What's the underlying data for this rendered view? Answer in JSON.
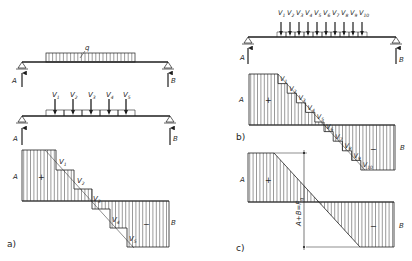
{
  "figure": {
    "panels": {
      "a": {
        "tag": "a)",
        "distributed_load_label": "q",
        "reaction_left": "A",
        "reaction_right": "B",
        "point_loads": [
          "V",
          "V",
          "V",
          "V",
          "V"
        ],
        "point_load_subs": [
          "1",
          "2",
          "3",
          "4",
          "5"
        ],
        "shear_labels": {
          "left": "A",
          "right": "B",
          "positive": "+",
          "negative": "−"
        }
      },
      "b": {
        "tag": "b)",
        "reaction_left": "A",
        "reaction_right": "B",
        "point_loads": [
          "V",
          "V",
          "V",
          "V",
          "V",
          "V",
          "V",
          "V",
          "V",
          "V"
        ],
        "point_load_subs": [
          "1",
          "2",
          "3",
          "4",
          "5",
          "6",
          "7",
          "8",
          "9",
          "10"
        ],
        "shear_labels": {
          "left": "A",
          "right": "B",
          "positive": "+",
          "negative": "−"
        }
      },
      "c": {
        "tag": "c)",
        "shear_labels": {
          "left": "A",
          "right": "B",
          "positive": "+",
          "negative": "−"
        },
        "dimension_label": "A+B=F",
        "dimension_sub": "q"
      }
    }
  }
}
